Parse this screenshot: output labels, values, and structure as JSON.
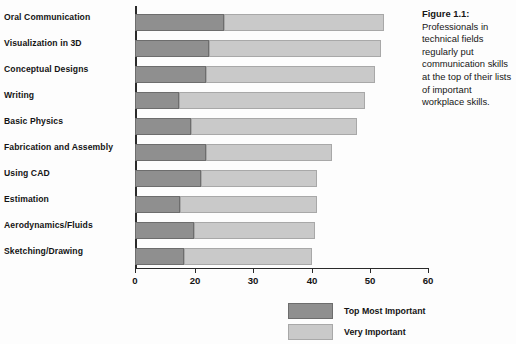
{
  "caption": {
    "label": "Figure 1.1:",
    "text": " Professionals in technical fields regularly put communication skills at the top of their lists of important workplace skills."
  },
  "legend": {
    "position": "bottom-right",
    "items": [
      {
        "name": "top-most-important",
        "label": "Top Most Important",
        "color": "#8f8f8f"
      },
      {
        "name": "very-important",
        "label": "Very Important",
        "color": "#c9c9c9"
      }
    ]
  },
  "axis": {
    "ticks": [
      "0",
      "20",
      "30",
      "40",
      "50",
      "60"
    ],
    "tick_positions_px": [
      0,
      60,
      118,
      177,
      235,
      293
    ]
  },
  "chart_data": {
    "type": "bar",
    "orientation": "horizontal",
    "stacked": true,
    "title": "",
    "xlabel": "",
    "ylabel": "",
    "xlim": [
      0,
      60
    ],
    "grid": false,
    "legend_position": "bottom-right",
    "tick_labels": [
      "0",
      "20",
      "30",
      "40",
      "50",
      "60"
    ],
    "categories": [
      "Oral Communication",
      "Visualization in 3D",
      "Conceptual Designs",
      "Writing",
      "Basic Physics",
      "Fabrication and Assembly",
      "Using CAD",
      "Estimation",
      "Aerodynamics/Fluids",
      "Sketching/Drawing"
    ],
    "series": [
      {
        "name": "Top Most Important",
        "color": "#8f8f8f",
        "values": [
          26.5,
          23.5,
          23,
          16.5,
          19,
          23,
          21.5,
          16.5,
          20,
          17
        ]
      },
      {
        "name": "Very Important",
        "color": "#c9c9c9",
        "values": [
          26.0,
          28.5,
          27.5,
          31.0,
          27.0,
          21.5,
          19.5,
          24.5,
          20.5,
          23.0
        ]
      }
    ],
    "totals": [
      52.5,
      52.0,
      50.5,
      47.5,
      46.0,
      44.5,
      41.0,
      41.0,
      40.5,
      40.0
    ]
  },
  "bars_px": [
    {
      "top": 8,
      "dark": 89,
      "light": 160
    },
    {
      "top": 34,
      "dark": 74,
      "light": 172
    },
    {
      "top": 60,
      "dark": 71,
      "light": 169
    },
    {
      "top": 86,
      "dark": 44,
      "light": 186
    },
    {
      "top": 112,
      "dark": 56,
      "light": 166
    },
    {
      "top": 138,
      "dark": 71,
      "light": 126
    },
    {
      "top": 164,
      "dark": 66,
      "light": 116
    },
    {
      "top": 190,
      "dark": 45,
      "light": 137
    },
    {
      "top": 216,
      "dark": 59,
      "light": 121
    },
    {
      "top": 242,
      "dark": 49,
      "light": 128
    }
  ],
  "label_tops_px": [
    12,
    38,
    64,
    90,
    116,
    142,
    168,
    194,
    220,
    246
  ]
}
